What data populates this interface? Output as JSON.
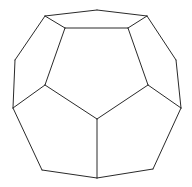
{
  "figure": {
    "title": "",
    "stroke_color": "#2a2a2a",
    "background_color": "#ffffff",
    "vertices": {
      "t1": [
        45,
        16
      ],
      "t2": [
        97,
        10
      ],
      "t3": [
        147,
        16
      ],
      "i1": [
        65,
        28
      ],
      "i2": [
        128,
        28
      ],
      "l1": [
        15,
        60
      ],
      "l2": [
        13,
        108
      ],
      "r1": [
        176,
        60
      ],
      "r2": [
        181,
        108
      ],
      "m1": [
        45,
        85
      ],
      "m2": [
        148,
        85
      ],
      "c": [
        97,
        119
      ],
      "b1": [
        42,
        170
      ],
      "b2": [
        97,
        178
      ],
      "b3": [
        153,
        169
      ]
    },
    "edges": [
      [
        "t1",
        "t2"
      ],
      [
        "t2",
        "t3"
      ],
      [
        "t1",
        "i1"
      ],
      [
        "i1",
        "i2"
      ],
      [
        "i2",
        "t3"
      ],
      [
        "t1",
        "l1"
      ],
      [
        "l1",
        "l2"
      ],
      [
        "t3",
        "r1"
      ],
      [
        "r1",
        "r2"
      ],
      [
        "i1",
        "m1"
      ],
      [
        "i2",
        "m2"
      ],
      [
        "m1",
        "l2"
      ],
      [
        "m2",
        "r2"
      ],
      [
        "m1",
        "c"
      ],
      [
        "m2",
        "c"
      ],
      [
        "l2",
        "b1"
      ],
      [
        "b1",
        "b2"
      ],
      [
        "b2",
        "b3"
      ],
      [
        "b3",
        "r2"
      ],
      [
        "c",
        "b2"
      ]
    ]
  }
}
